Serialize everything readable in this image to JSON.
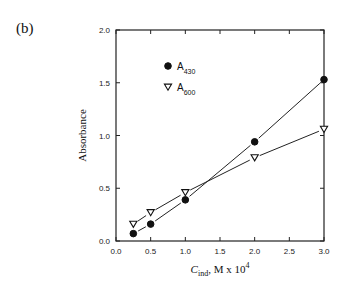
{
  "panel_label": "(b)",
  "chart_data": {
    "type": "line",
    "title": "",
    "xlabel": "C_ind, M x 10^4",
    "xlabel_parts": {
      "main": "C",
      "sub": "ind",
      "rest": ", M x 10",
      "sup": "4"
    },
    "ylabel": "Absorbance",
    "xlim": [
      0.0,
      3.0
    ],
    "ylim": [
      0.0,
      2.0
    ],
    "xticks": [
      "0.0",
      "0.5",
      "1.0",
      "1.5",
      "2.0",
      "2.5",
      "3.0"
    ],
    "yticks": [
      "0.0",
      "0.5",
      "1.0",
      "1.5",
      "2.0"
    ],
    "grid": false,
    "legend_position": "upper left",
    "x": [
      0.25,
      0.5,
      1.0,
      2.0,
      3.0
    ],
    "series": [
      {
        "name": "A430",
        "label_main": "A",
        "label_sub": "430",
        "marker": "filled-circle",
        "values": [
          0.07,
          0.16,
          0.39,
          0.94,
          1.53
        ]
      },
      {
        "name": "A600",
        "label_main": "A",
        "label_sub": "600",
        "marker": "open-triangle-down",
        "values": [
          0.16,
          0.27,
          0.46,
          0.79,
          1.06
        ]
      }
    ]
  }
}
